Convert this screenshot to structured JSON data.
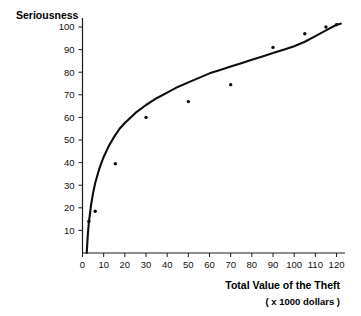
{
  "chart_data": {
    "type": "scatter",
    "title": "",
    "xlabel": "Total Value of the Theft",
    "xlabel_sub": "( x 1000 dollars )",
    "ylabel": "Seriousness",
    "xlim": [
      0,
      124
    ],
    "ylim": [
      0,
      104
    ],
    "grid": false,
    "legend": null,
    "x_ticks": [
      0,
      10,
      20,
      30,
      40,
      50,
      60,
      70,
      80,
      90,
      100,
      110,
      120
    ],
    "y_ticks": [
      10,
      20,
      30,
      40,
      50,
      60,
      70,
      80,
      90,
      100
    ],
    "x": [
      3,
      6,
      15.5,
      30,
      50,
      70,
      90,
      105,
      115,
      120
    ],
    "y": [
      14,
      18.5,
      39.5,
      60,
      67,
      74.5,
      91,
      97,
      100,
      101
    ],
    "points": [
      {
        "x": 3,
        "y": 14
      },
      {
        "x": 6,
        "y": 18.5
      },
      {
        "x": 15.5,
        "y": 39.5
      },
      {
        "x": 30,
        "y": 60
      },
      {
        "x": 50,
        "y": 67
      },
      {
        "x": 70,
        "y": 74.5
      },
      {
        "x": 90,
        "y": 91
      },
      {
        "x": 105,
        "y": 97
      },
      {
        "x": 115,
        "y": 100
      },
      {
        "x": 120,
        "y": 101
      }
    ],
    "fit_curve": {
      "description": "logarithmic best-fit curve",
      "x": [
        2,
        2.5,
        3,
        4,
        5,
        6,
        8,
        10,
        12.5,
        15,
        17.5,
        20,
        25,
        30,
        35,
        40,
        45,
        50,
        55,
        60,
        65,
        70,
        75,
        80,
        85,
        90,
        95,
        100,
        105,
        110,
        115,
        120,
        122
      ],
      "y": [
        0,
        8,
        13.5,
        21,
        26.5,
        31,
        37.5,
        42.5,
        47.5,
        51.5,
        55,
        57.5,
        62,
        65.5,
        68.5,
        71,
        73.5,
        75.5,
        77.5,
        79.5,
        81,
        82.5,
        84,
        85.5,
        87,
        88.5,
        90,
        91.5,
        93.5,
        96,
        98.5,
        101,
        101.5
      ]
    }
  },
  "axis": {
    "y_tick_labels": [
      "100",
      "90",
      "80",
      "70",
      "60",
      "50",
      "40",
      "30",
      "20",
      "10"
    ],
    "x_tick_labels": [
      "0",
      "10",
      "20",
      "30",
      "40",
      "50",
      "60",
      "70",
      "80",
      "90",
      "100",
      "110",
      "120"
    ]
  }
}
